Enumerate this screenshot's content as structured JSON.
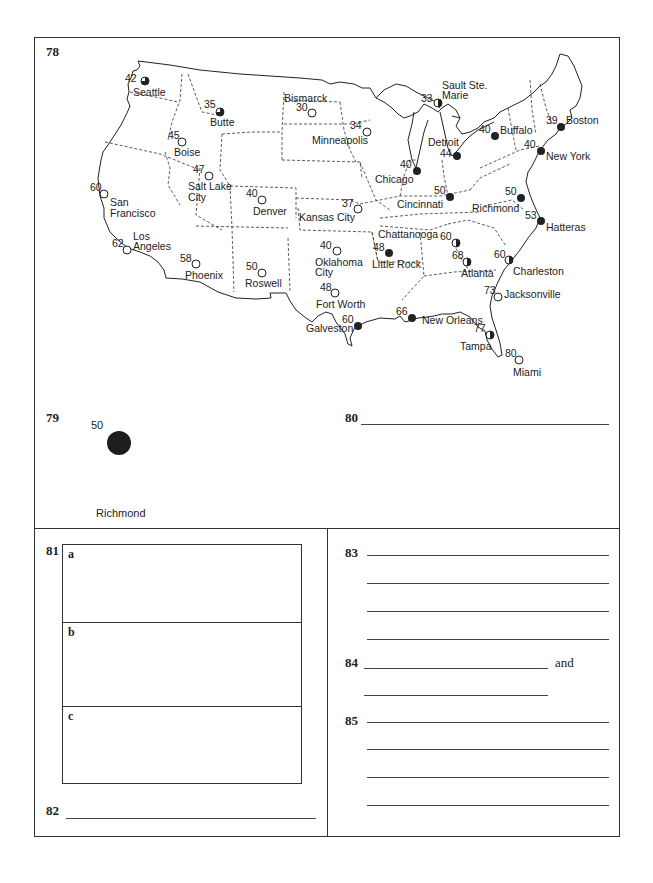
{
  "questions": {
    "q78": {
      "number": "78"
    },
    "q79": {
      "number": "79",
      "station": {
        "temperature": "50",
        "city": "Richmond",
        "cover": "overcast"
      }
    },
    "q80": {
      "number": "80"
    },
    "q81": {
      "number": "81",
      "parts": [
        "a",
        "b",
        "c"
      ]
    },
    "q82": {
      "number": "82"
    },
    "q83": {
      "number": "83"
    },
    "q84": {
      "number": "84",
      "connector": "and"
    },
    "q85": {
      "number": "85"
    }
  },
  "map": {
    "stations": [
      {
        "city": "Seattle",
        "temp": "42",
        "cover": "three-quarter"
      },
      {
        "city": "Butte",
        "temp": "35",
        "cover": "three-quarter"
      },
      {
        "city": "Bismarck",
        "temp": "30",
        "cover": "clear"
      },
      {
        "city": "Boise",
        "temp": "45",
        "cover": "clear"
      },
      {
        "city": "Salt Lake City",
        "temp": "47",
        "cover": "clear"
      },
      {
        "city": "San Francisco",
        "temp": "60",
        "cover": "clear"
      },
      {
        "city": "Los Angeles",
        "temp": "62",
        "cover": "clear"
      },
      {
        "city": "Denver",
        "temp": "40",
        "cover": "clear"
      },
      {
        "city": "Phoenix",
        "temp": "58",
        "cover": "clear"
      },
      {
        "city": "Roswell",
        "temp": "50",
        "cover": "clear"
      },
      {
        "city": "Minneapolis",
        "temp": "34",
        "cover": "clear"
      },
      {
        "city": "Kansas City",
        "temp": "37",
        "cover": "clear"
      },
      {
        "city": "Oklahoma City",
        "temp": "40",
        "cover": "clear"
      },
      {
        "city": "Fort Worth",
        "temp": "48",
        "cover": "clear"
      },
      {
        "city": "Galveston",
        "temp": "60",
        "cover": "overcast"
      },
      {
        "city": "Sault Ste. Marie",
        "temp": "33",
        "cover": "half"
      },
      {
        "city": "Chicago",
        "temp": "40",
        "cover": "overcast"
      },
      {
        "city": "Detroit",
        "temp": "44",
        "cover": "overcast"
      },
      {
        "city": "Cincinnati",
        "temp": "50",
        "cover": "overcast"
      },
      {
        "city": "Buffalo",
        "temp": "40",
        "cover": "overcast"
      },
      {
        "city": "Boston",
        "temp": "39",
        "cover": "overcast"
      },
      {
        "city": "New York",
        "temp": "40",
        "cover": "overcast"
      },
      {
        "city": "Richmond",
        "temp": "50",
        "cover": "overcast"
      },
      {
        "city": "Hatteras",
        "temp": "53",
        "cover": "overcast"
      },
      {
        "city": "Chattanooga",
        "temp": "60",
        "cover": "half"
      },
      {
        "city": "Little Rock",
        "temp": "48",
        "cover": "overcast"
      },
      {
        "city": "Atlanta",
        "temp": "68",
        "cover": "half"
      },
      {
        "city": "Charleston",
        "temp": "60",
        "cover": "half"
      },
      {
        "city": "Jacksonville",
        "temp": "73",
        "cover": "clear"
      },
      {
        "city": "New Orleans",
        "temp": "66",
        "cover": "overcast"
      },
      {
        "city": "Tampa",
        "temp": "77",
        "cover": "half"
      },
      {
        "city": "Miami",
        "temp": "80",
        "cover": "clear"
      }
    ]
  }
}
